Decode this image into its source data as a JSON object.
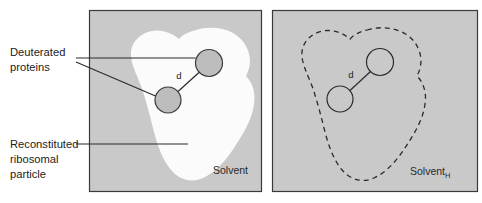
{
  "figure": {
    "background_color": "#ffffff"
  },
  "callouts": [
    {
      "id": "deuterated-proteins",
      "lines": [
        "Deuterated",
        "proteins"
      ],
      "line1": "Deuterated",
      "line2": "proteins"
    },
    {
      "id": "reconstituted-ribosomal-particle",
      "lines": [
        "Reconstituted",
        "ribosomal",
        "particle"
      ],
      "line1": "Reconstituted",
      "line2": "ribosomal",
      "line3": "particle"
    }
  ],
  "panels": [
    {
      "id": "panel-left",
      "label": "Solvent",
      "label_subscript": "",
      "panel_fill": "#c9c9c9",
      "particle_fill": "#fbfbfb",
      "particle_outline": "none",
      "particle_style": "filled-blob",
      "border_color": "#3a3a3a",
      "distance_label": "d",
      "proteins": [
        {
          "id": "protein-upper",
          "fill": "#bdbdbd",
          "stroke": "#3a3a3a",
          "cx": 209,
          "cy": 63,
          "r": 13.5
        },
        {
          "id": "protein-lower",
          "fill": "#bdbdbd",
          "stroke": "#3a3a3a",
          "cx": 168,
          "cy": 100,
          "r": 13.0
        }
      ]
    },
    {
      "id": "panel-right",
      "label": "Solvent",
      "label_subscript": "H",
      "panel_fill": "#c9c9c9",
      "particle_fill": "none",
      "particle_outline": "#2a2a2a",
      "particle_style": "dashed-outline",
      "border_color": "#3a3a3a",
      "distance_label": "d",
      "proteins": [
        {
          "id": "protein-upper",
          "fill": "#c9c9c9",
          "stroke": "#2a2a2a",
          "cx": 380,
          "cy": 62,
          "r": 13.5
        },
        {
          "id": "protein-lower",
          "fill": "#c9c9c9",
          "stroke": "#2a2a2a",
          "cx": 340,
          "cy": 99,
          "r": 13.0
        }
      ]
    }
  ],
  "colors": {
    "panel_background": "#c9c9c9",
    "particle_white": "#fbfbfb",
    "protein_gray": "#bdbdbd",
    "line_dark": "#2a2a2a",
    "page_white": "#ffffff"
  }
}
